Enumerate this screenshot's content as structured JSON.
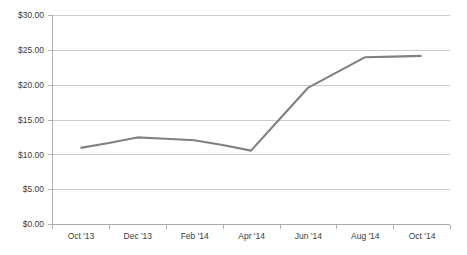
{
  "chart_data": {
    "type": "line",
    "title": "",
    "subtitle": "",
    "xlabel": "",
    "ylabel": "",
    "categories": [
      "Oct '13",
      "Nov '13",
      "Dec '13",
      "Jan '14",
      "Feb '14",
      "Mar '14",
      "Apr '14",
      "May '14",
      "Jun '14",
      "Jul '14",
      "Aug '14",
      "Sep '14",
      "Oct '14"
    ],
    "tick_labels_x": [
      "Oct '13",
      "Dec '13",
      "Feb '14",
      "Apr '14",
      "Jun '14",
      "Aug '14",
      "Oct '14"
    ],
    "tick_labels_y": [
      "$0.00",
      "$5.00",
      "$10.00",
      "$15.00",
      "$20.00",
      "$25.00",
      "$30.00"
    ],
    "tick_values_y": [
      0,
      5,
      10,
      15,
      20,
      25,
      30
    ],
    "series": [
      {
        "name": "",
        "values": [
          11.0,
          11.7,
          12.5,
          12.3,
          12.1,
          11.4,
          10.6,
          15.1,
          19.6,
          21.8,
          24.0,
          24.1,
          24.2
        ],
        "color": "#808080"
      }
    ],
    "ylim": [
      0,
      30
    ],
    "grid": "horizontal",
    "legend": "none",
    "annotations": []
  },
  "axis": {
    "y_labels": [
      "$30.00",
      "$25.00",
      "$20.00",
      "$15.00",
      "$10.00",
      "$5.00",
      "$0.00"
    ],
    "x_labels": [
      "Oct '13",
      "Dec '13",
      "Feb '14",
      "Apr '14",
      "Jun '14",
      "Aug '14",
      "Oct '14"
    ]
  },
  "colors": {
    "line": "#808080",
    "grid": "#bfbfbf",
    "axis": "#a6a6a6",
    "text": "#3b3b3b",
    "background": "#ffffff"
  }
}
